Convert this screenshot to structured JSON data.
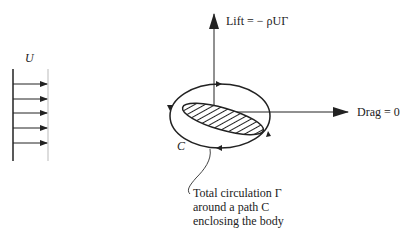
{
  "diagram": {
    "freestream_label": "U",
    "lift_label": "Lift = − ρUΓ",
    "drag_label": "Drag = 0",
    "contour_label": "C",
    "annotation_lines": [
      "Total circulation Γ",
      "around a path C",
      "enclosing the body"
    ],
    "freestream_arrow_count": 5,
    "colors": {
      "line": "#222222",
      "background": "#ffffff"
    }
  }
}
